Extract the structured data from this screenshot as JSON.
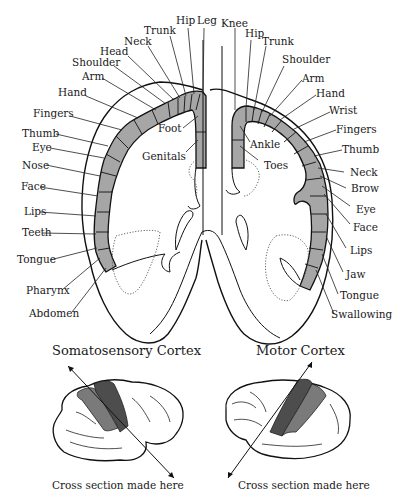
{
  "figure": {
    "type": "anatomical-diagram",
    "colors": {
      "cortex_band": "#a6a6a6",
      "region_dark": "#4d4d4d",
      "region_mid": "#7a7a7a",
      "outline": "#111111"
    }
  },
  "somatosensory": {
    "title": "Somatosensory Cortex",
    "section_note": "Cross section made here",
    "labels_outer": [
      "Hip",
      "Trunk",
      "Neck",
      "Head",
      "Shoulder",
      "Arm",
      "Hand",
      "Fingers",
      "Thumb",
      "Eye",
      "Nose",
      "Face",
      "Lips",
      "Teeth",
      "Tongue",
      "Pharynx",
      "Abdomen"
    ],
    "labels_inner": [
      "Leg",
      "Foot",
      "Genitals"
    ]
  },
  "motor": {
    "title": "Motor Cortex",
    "section_note": "Cross section made here",
    "labels_outer": [
      "Knee",
      "Hip",
      "Trunk",
      "Shoulder",
      "Arm",
      "Hand",
      "Wrist",
      "Fingers",
      "Thumb",
      "Neck",
      "Brow",
      "Eye",
      "Face",
      "Lips",
      "Jaw",
      "Tongue",
      "Swallowing"
    ],
    "labels_inner": [
      "Ankle",
      "Toes"
    ]
  },
  "labels": {
    "s_hip": "Hip",
    "s_leg": "Leg",
    "s_trunk": "Trunk",
    "s_neck": "Neck",
    "s_head": "Head",
    "s_shoulder": "Shoulder",
    "s_arm": "Arm",
    "s_hand": "Hand",
    "s_fingers": "Fingers",
    "s_thumb": "Thumb",
    "s_eye": "Eye",
    "s_nose": "Nose",
    "s_face": "Face",
    "s_lips": "Lips",
    "s_teeth": "Teeth",
    "s_tongue": "Tongue",
    "s_pharynx": "Pharynx",
    "s_abdomen": "Abdomen",
    "s_foot": "Foot",
    "s_genitals": "Genitals",
    "m_knee": "Knee",
    "m_hip": "Hip",
    "m_trunk": "Trunk",
    "m_shoulder": "Shoulder",
    "m_arm": "Arm",
    "m_hand": "Hand",
    "m_wrist": "Wrist",
    "m_fingers": "Fingers",
    "m_thumb": "Thumb",
    "m_neck": "Neck",
    "m_brow": "Brow",
    "m_eye": "Eye",
    "m_face": "Face",
    "m_lips": "Lips",
    "m_jaw": "Jaw",
    "m_tongue": "Tongue",
    "m_swallowing": "Swallowing",
    "m_ankle": "Ankle",
    "m_toes": "Toes"
  },
  "captions": {
    "somatosensory_title": "Somatosensory Cortex",
    "motor_title": "Motor Cortex",
    "somatosensory_note": "Cross section made here",
    "motor_note": "Cross section made here"
  }
}
